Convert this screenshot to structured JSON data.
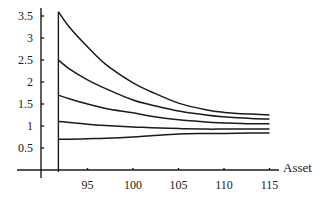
{
  "chart_data": {
    "type": "line",
    "title": "",
    "xlabel": "Asset",
    "ylabel": "",
    "xlim": [
      88,
      116
    ],
    "ylim": [
      0,
      3.7
    ],
    "grid": false,
    "legend": null,
    "x_ticks": [
      95,
      100,
      105,
      110,
      115
    ],
    "x_tick_labels": [
      "95",
      "100",
      "105",
      "110",
      "115"
    ],
    "y_ticks": [
      0.5,
      1,
      1.5,
      2,
      2.5,
      3,
      3.5
    ],
    "y_tick_labels": [
      "0.5",
      "1",
      "1.5",
      "2",
      "2.5",
      "3",
      "3.5"
    ],
    "vertical_line_x": 91.8,
    "x": [
      91.8,
      93,
      95,
      97,
      100,
      102,
      105,
      108,
      110,
      113,
      115
    ],
    "series": [
      {
        "name": "curve-1",
        "values": [
          3.6,
          3.25,
          2.8,
          2.4,
          1.98,
          1.78,
          1.52,
          1.37,
          1.31,
          1.27,
          1.25
        ]
      },
      {
        "name": "curve-2",
        "values": [
          2.5,
          2.3,
          2.05,
          1.85,
          1.59,
          1.48,
          1.34,
          1.25,
          1.21,
          1.17,
          1.16
        ]
      },
      {
        "name": "curve-3",
        "values": [
          1.7,
          1.62,
          1.5,
          1.4,
          1.3,
          1.22,
          1.14,
          1.09,
          1.07,
          1.05,
          1.05
        ]
      },
      {
        "name": "curve-4",
        "values": [
          1.1,
          1.08,
          1.04,
          1.01,
          0.98,
          0.96,
          0.94,
          0.93,
          0.93,
          0.93,
          0.93
        ]
      },
      {
        "name": "curve-5",
        "values": [
          0.7,
          0.7,
          0.71,
          0.72,
          0.75,
          0.78,
          0.82,
          0.83,
          0.83,
          0.84,
          0.84
        ]
      }
    ]
  }
}
